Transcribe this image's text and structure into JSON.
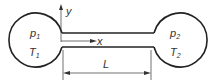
{
  "diagram": {
    "left_vessel": {
      "pressure": "p",
      "pressure_sub": "1",
      "temperature": "T",
      "temperature_sub": "1"
    },
    "right_vessel": {
      "pressure": "p",
      "pressure_sub": "2",
      "temperature": "T",
      "temperature_sub": "2"
    },
    "axes": {
      "x": "x",
      "y": "y"
    },
    "dimension": {
      "length": "L"
    },
    "colors": {
      "stroke": "#222222",
      "text": "#333333",
      "background": "#ffffff"
    }
  }
}
